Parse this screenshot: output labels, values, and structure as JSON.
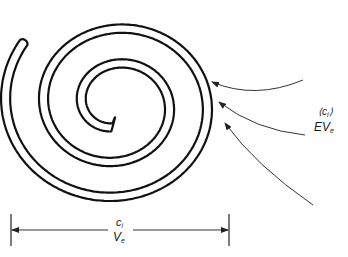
{
  "diagram": {
    "type": "spiral-schematic",
    "stroke_color": "#111111",
    "arrow_label": {
      "line1_text": "⟨c",
      "line1_sub": "i",
      "line1_close": "⟩",
      "line2_text": "EV",
      "line2_sub": "e"
    },
    "dimension_label": {
      "line1_text": "c",
      "line1_sub": "i",
      "line2_text": "V",
      "line2_sub": "e"
    },
    "arrows_count": 3
  }
}
